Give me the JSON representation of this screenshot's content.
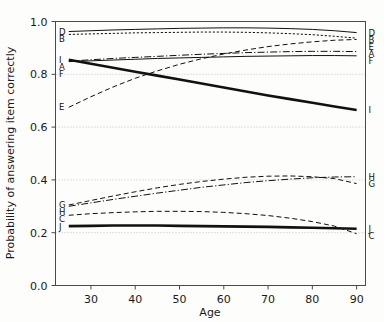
{
  "chart_data": {
    "type": "line",
    "title": "",
    "xlabel": "Age",
    "ylabel": "Probability of answering item correctly",
    "xlim": [
      22,
      92
    ],
    "ylim": [
      0.0,
      1.0
    ],
    "grid": true,
    "legend_position": "inline-endpoint-labels",
    "xticks": [
      30,
      40,
      50,
      60,
      70,
      80,
      90
    ],
    "xtick_labels": [
      "30",
      "40",
      "50",
      "60",
      "70",
      "80",
      "90"
    ],
    "yticks": [
      0.0,
      0.2,
      0.4,
      0.6,
      0.8,
      1.0
    ],
    "ytick_labels": [
      "0.0",
      "0.2",
      "0.4",
      "0.6",
      "0.8",
      "1.0"
    ],
    "x": [
      25,
      30,
      35,
      40,
      45,
      50,
      55,
      60,
      65,
      70,
      75,
      80,
      85,
      90
    ],
    "series": [
      {
        "name": "A",
        "label_left": "A",
        "label_right": "A",
        "style": "dash-dot",
        "width": "thin",
        "values": [
          0.85,
          0.855,
          0.86,
          0.864,
          0.868,
          0.872,
          0.876,
          0.879,
          0.882,
          0.884,
          0.886,
          0.887,
          0.887,
          0.886
        ]
      },
      {
        "name": "B",
        "label_left": "B",
        "label_right": "B",
        "style": "dotted-dash",
        "width": "thin",
        "values": [
          0.951,
          0.953,
          0.955,
          0.957,
          0.958,
          0.959,
          0.96,
          0.96,
          0.959,
          0.957,
          0.954,
          0.95,
          0.944,
          0.937
        ]
      },
      {
        "name": "C",
        "label_left": "C",
        "label_right": "C",
        "style": "dashed",
        "width": "thin",
        "values": [
          0.266,
          0.272,
          0.276,
          0.279,
          0.281,
          0.281,
          0.28,
          0.277,
          0.272,
          0.265,
          0.255,
          0.242,
          0.225,
          0.196
        ]
      },
      {
        "name": "D",
        "label_left": "D",
        "label_right": "D",
        "style": "solid",
        "width": "thin",
        "values": [
          0.962,
          0.965,
          0.968,
          0.97,
          0.972,
          0.974,
          0.975,
          0.976,
          0.976,
          0.975,
          0.973,
          0.97,
          0.965,
          0.958
        ]
      },
      {
        "name": "E",
        "label_left": "E",
        "label_right": "E",
        "style": "dashed",
        "width": "thin",
        "values": [
          0.675,
          0.715,
          0.752,
          0.785,
          0.813,
          0.838,
          0.859,
          0.877,
          0.892,
          0.905,
          0.915,
          0.923,
          0.929,
          0.932
        ]
      },
      {
        "name": "F",
        "label_left": "F",
        "label_right": "F",
        "style": "solid",
        "width": "thin",
        "values": [
          0.848,
          0.851,
          0.854,
          0.857,
          0.86,
          0.862,
          0.864,
          0.866,
          0.868,
          0.869,
          0.87,
          0.871,
          0.871,
          0.87
        ]
      },
      {
        "name": "G",
        "label_left": "G",
        "label_right": "G",
        "style": "dashed",
        "width": "thin",
        "values": [
          0.305,
          0.322,
          0.339,
          0.355,
          0.37,
          0.383,
          0.394,
          0.403,
          0.41,
          0.414,
          0.415,
          0.412,
          0.405,
          0.386
        ]
      },
      {
        "name": "H",
        "label_left": "H",
        "label_right": "H",
        "style": "dash-dot",
        "width": "thin",
        "values": [
          0.3,
          0.313,
          0.326,
          0.338,
          0.35,
          0.361,
          0.372,
          0.381,
          0.39,
          0.397,
          0.403,
          0.408,
          0.411,
          0.412
        ]
      },
      {
        "name": "I",
        "label_left": "I",
        "label_right": "I",
        "style": "solid",
        "width": "thick",
        "values": [
          0.855,
          0.84,
          0.825,
          0.81,
          0.795,
          0.78,
          0.765,
          0.75,
          0.735,
          0.72,
          0.706,
          0.692,
          0.678,
          0.665
        ]
      },
      {
        "name": "J",
        "label_left": "J",
        "label_right": "J",
        "style": "solid",
        "width": "thick",
        "values": [
          0.225,
          0.226,
          0.227,
          0.227,
          0.227,
          0.226,
          0.225,
          0.224,
          0.223,
          0.222,
          0.22,
          0.219,
          0.217,
          0.215
        ]
      }
    ]
  },
  "axes": {
    "xlabel": "Age",
    "ylabel": "Probability of answering item correctly"
  }
}
